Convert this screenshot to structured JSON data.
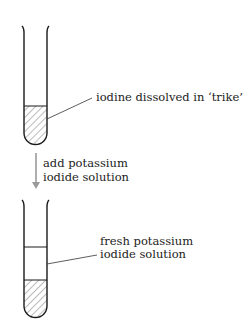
{
  "diagram": {
    "stage1": {
      "label": "iodine dissolved in ‘trike’"
    },
    "step": {
      "line1": "add potassium",
      "line2": "iodide solution",
      "arrow_color": "#9a9a9a"
    },
    "stage2": {
      "label_line1": "fresh potassium",
      "label_line2": "iodide solution"
    },
    "colors": {
      "outline": "#1a1a1a",
      "hatch": "#666666"
    }
  }
}
